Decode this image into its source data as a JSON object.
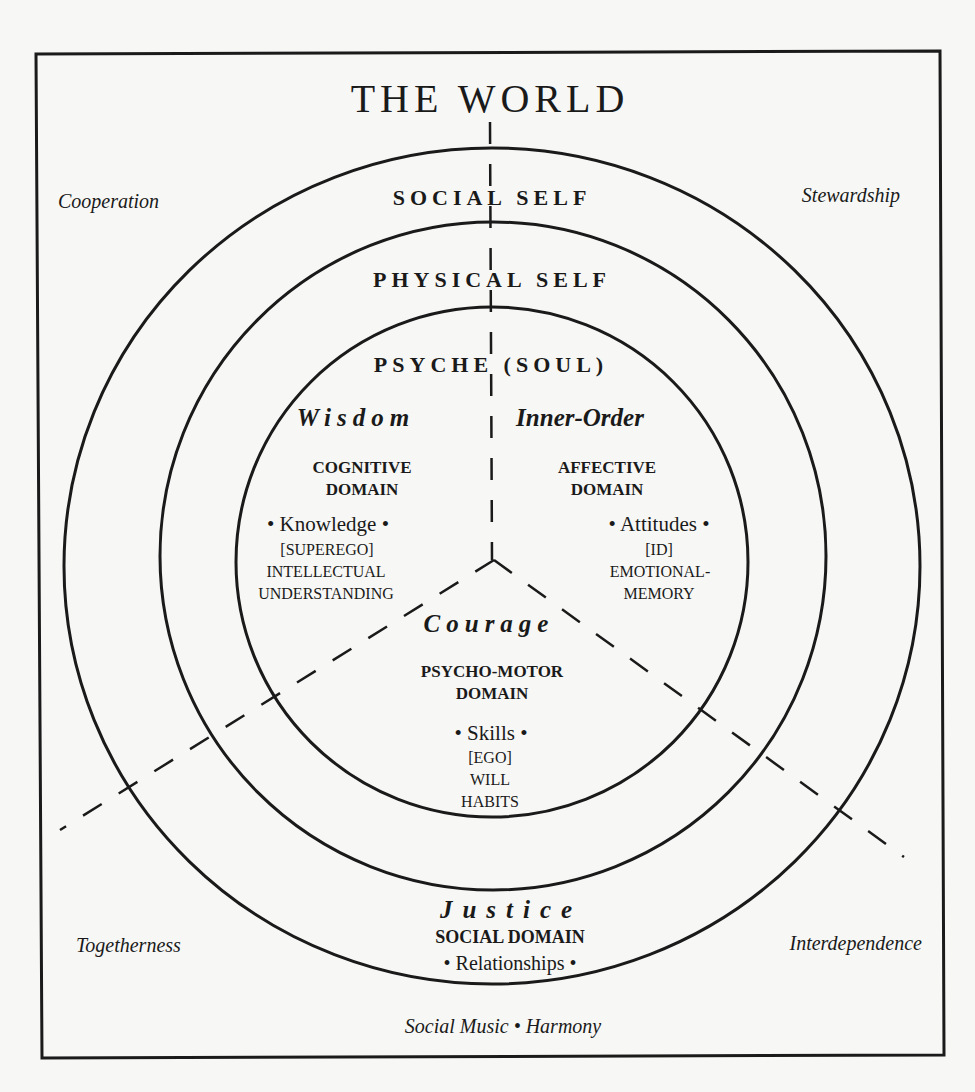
{
  "title": "THE WORLD",
  "rings": {
    "social_self": "SOCIAL SELF",
    "physical_self": "PHYSICAL SELF",
    "psyche": "PSYCHE (SOUL)"
  },
  "corners": {
    "top_left": "Cooperation",
    "top_right": "Stewardship",
    "bottom_left": "Togetherness",
    "bottom_right": "Interdependence",
    "bottom_center": "Social Music • Harmony"
  },
  "sectors": {
    "cognitive": {
      "virtue": "Wisdom",
      "domain_line1": "COGNITIVE",
      "domain_line2": "DOMAIN",
      "item": "• Knowledge •",
      "sub1": "[SUPEREGO]",
      "sub2": "INTELLECTUAL",
      "sub3": "UNDERSTANDING"
    },
    "affective": {
      "virtue": "Inner-Order",
      "domain_line1": "AFFECTIVE",
      "domain_line2": "DOMAIN",
      "item": "• Attitudes •",
      "sub1": "[ID]",
      "sub2": "EMOTIONAL-",
      "sub3": "MEMORY"
    },
    "psychomotor": {
      "virtue": "Courage",
      "domain_line1": "PSYCHO-MOTOR",
      "domain_line2": "DOMAIN",
      "item": "• Skills •",
      "sub1": "[EGO]",
      "sub2": "WILL",
      "sub3": "HABITS"
    },
    "social": {
      "virtue": "Justice",
      "domain_line1": "SOCIAL DOMAIN",
      "item": "• Relationships •"
    }
  },
  "colors": {
    "ink": "#1a1a1a",
    "paper": "#f7f7f5"
  }
}
